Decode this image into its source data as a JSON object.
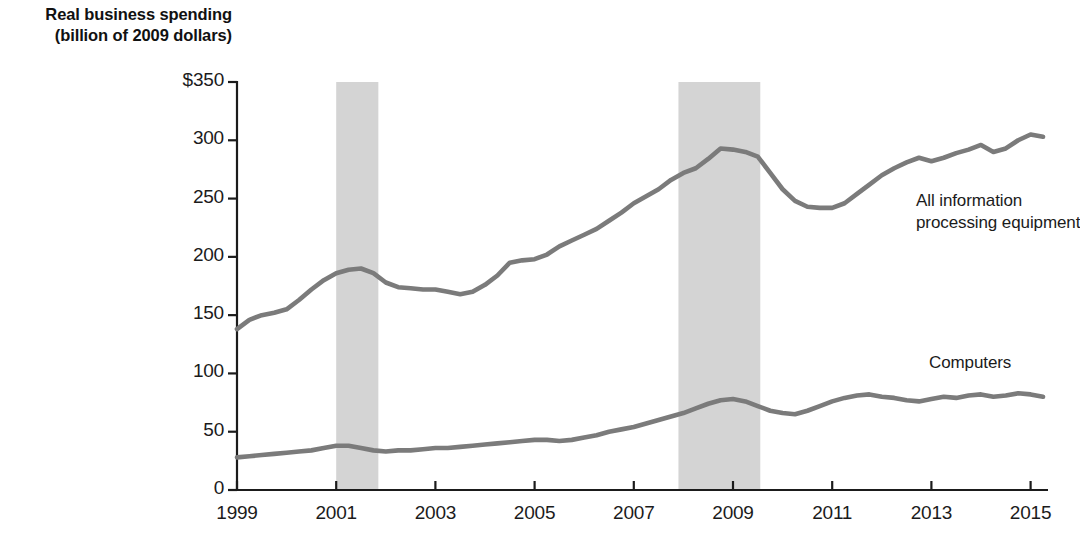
{
  "chart_data": {
    "type": "line",
    "title": "",
    "ylabel_lines": [
      "Real business spending",
      "(billion of 2009 dollars)"
    ],
    "xlabel": "",
    "ylim": [
      0,
      350
    ],
    "xlim": [
      1999,
      2015.5
    ],
    "grid": false,
    "legend_position": "inline-right",
    "ytick_labels": [
      "$350",
      "300",
      "250",
      "200",
      "150",
      "100",
      "50",
      "0"
    ],
    "ytick_values": [
      350,
      300,
      250,
      200,
      150,
      100,
      50,
      0
    ],
    "xtick_labels": [
      "1999",
      "2001",
      "2003",
      "2005",
      "2007",
      "2009",
      "2011",
      "2013",
      "2015"
    ],
    "xtick_values": [
      1999,
      2001,
      2003,
      2005,
      2007,
      2009,
      2011,
      2013,
      2015
    ],
    "line_color": "#7b7b7b",
    "recession_color": "#d4d4d4",
    "shaded_regions": [
      {
        "label": "recession",
        "x_start": 2001.0,
        "x_end": 2001.85
      },
      {
        "label": "recession",
        "x_start": 2007.9,
        "x_end": 2009.55
      }
    ],
    "x": [
      1999.0,
      1999.25,
      1999.5,
      1999.75,
      2000.0,
      2000.25,
      2000.5,
      2000.75,
      2001.0,
      2001.25,
      2001.5,
      2001.75,
      2002.0,
      2002.25,
      2002.5,
      2002.75,
      2003.0,
      2003.25,
      2003.5,
      2003.75,
      2004.0,
      2004.25,
      2004.5,
      2004.75,
      2005.0,
      2005.25,
      2005.5,
      2005.75,
      2006.0,
      2006.25,
      2006.5,
      2006.75,
      2007.0,
      2007.25,
      2007.5,
      2007.75,
      2008.0,
      2008.25,
      2008.5,
      2008.75,
      2009.0,
      2009.25,
      2009.5,
      2009.75,
      2010.0,
      2010.25,
      2010.5,
      2010.75,
      2011.0,
      2011.25,
      2011.5,
      2011.75,
      2012.0,
      2012.25,
      2012.5,
      2012.75,
      2013.0,
      2013.25,
      2013.5,
      2013.75,
      2014.0,
      2014.25,
      2014.5,
      2014.75,
      2015.0,
      2015.25
    ],
    "series": [
      {
        "name": "All information processing equipment",
        "label_lines": [
          "All information",
          "processing equipment"
        ],
        "values": [
          138,
          146,
          150,
          152,
          155,
          163,
          172,
          180,
          186,
          189,
          190,
          186,
          178,
          174,
          173,
          172,
          172,
          170,
          168,
          170,
          176,
          184,
          195,
          197,
          198,
          202,
          209,
          214,
          219,
          224,
          231,
          238,
          246,
          252,
          258,
          266,
          272,
          276,
          284,
          293,
          292,
          290,
          286,
          272,
          258,
          248,
          243,
          242,
          242,
          246,
          254,
          262,
          270,
          276,
          281,
          285,
          282,
          285,
          289,
          292,
          296,
          290,
          293,
          300,
          305,
          303
        ]
      },
      {
        "name": "Computers",
        "label_lines": [
          "Computers"
        ],
        "values": [
          28,
          29,
          30,
          31,
          32,
          33,
          34,
          36,
          38,
          38,
          36,
          34,
          33,
          34,
          34,
          35,
          36,
          36,
          37,
          38,
          39,
          40,
          41,
          42,
          43,
          43,
          42,
          43,
          45,
          47,
          50,
          52,
          54,
          57,
          60,
          63,
          66,
          70,
          74,
          77,
          78,
          76,
          72,
          68,
          66,
          65,
          68,
          72,
          76,
          79,
          81,
          82,
          80,
          79,
          77,
          76,
          78,
          80,
          79,
          81,
          82,
          80,
          81,
          83,
          82,
          80
        ]
      }
    ],
    "computers_late_values": [
      82,
      78,
      74,
      77,
      80,
      79,
      82,
      81,
      84,
      82,
      81,
      80,
      79,
      78,
      82,
      81
    ]
  },
  "geometry": {
    "plot_left": 237,
    "plot_right": 1042,
    "plot_top": 82,
    "plot_bottom": 490,
    "x_origin_year": 1999,
    "px_per_year": 49.6,
    "y_top_value": 350,
    "y_bottom_value": 0
  },
  "labels": {
    "all_info_line1": "All information",
    "all_info_line2": "processing equipment",
    "computers": "Computers",
    "axis_title_line1": "Real business spending",
    "axis_title_line2": "(billion of 2009 dollars)"
  }
}
